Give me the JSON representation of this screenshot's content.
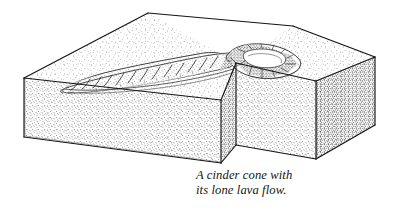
{
  "figure": {
    "kind": "block-diagram",
    "medium": "pen-and-ink stipple line drawing",
    "background_color": "#ffffff",
    "ink_color": "#1a1a1a",
    "stipple_color": "#444444"
  },
  "caption": {
    "line1": "A cinder cone with",
    "line2": "its lone lava flow.",
    "style": "italic-serif",
    "color": "#141414"
  },
  "labels": {
    "block": "crustal block",
    "top_surface": "ground surface",
    "left_face": "front-left cut face",
    "right_face": "front-right cut face",
    "notch_face": "notch cut face",
    "cone": "cinder cone",
    "crater": "summit crater",
    "lava_flow": "lava flow",
    "pressure_ridges": "pressure ridges"
  },
  "geometry": {
    "top_apex": [
      148,
      13
    ],
    "left_corner": [
      24,
      78
    ],
    "notch_inner_corner": [
      236,
      63
    ],
    "right_apex": [
      375,
      57
    ],
    "block_depth": 62
  },
  "shading": {
    "top_stipple_density": "light",
    "left_face_density": "medium",
    "right_face_density": "heavy",
    "notch_face_density": "medium-heavy"
  },
  "counts": {
    "pressure_ridges": 13,
    "cone_hachures": 12
  }
}
